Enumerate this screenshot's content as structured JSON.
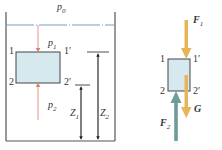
{
  "left_diagram": {
    "surface_pressure": "p",
    "surface_pressure_sub": "0",
    "top_pressure": "p",
    "top_pressure_sub": "1",
    "bottom_pressure": "p",
    "bottom_pressure_sub": "2",
    "corner_top_left": "1",
    "corner_top_right": "1′",
    "corner_bottom_left": "2",
    "corner_bottom_right": "2′",
    "height1": "Z",
    "height1_sub": "1",
    "height2": "Z",
    "height2_sub": "2"
  },
  "right_diagram": {
    "force_top": "F",
    "force_top_sub": "1",
    "force_bottom": "F",
    "force_bottom_sub": "2",
    "weight": "G",
    "corner_top_left": "1",
    "corner_top_right": "1′",
    "corner_bottom_left": "2",
    "corner_bottom_right": "2′"
  },
  "colors": {
    "container": "#555555",
    "water_line": "#7a9cc6",
    "block_fill": "#d6e9ee",
    "block_stroke": "#444444",
    "pressure_arrow": "#d9826b",
    "force_orange": "#e8b45a",
    "force_teal": "#6e9c98"
  }
}
